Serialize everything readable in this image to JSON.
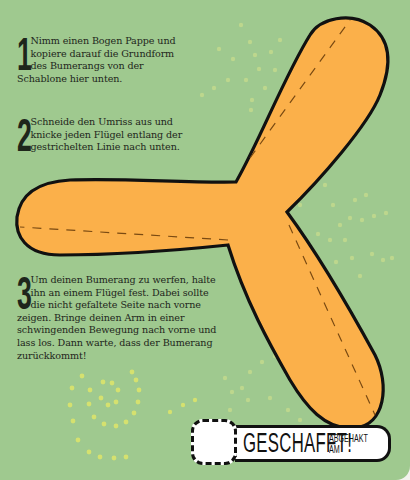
{
  "colors": {
    "background": "#9fc98f",
    "boomerang_fill": "#fbb04a",
    "outline": "#111111",
    "dots": "#d9e48a"
  },
  "steps": [
    {
      "number": "1",
      "text": "Nimm einen Bogen Pappe und kopiere darauf die Grundform des Bumerangs von der Schablone hier unten."
    },
    {
      "number": "2",
      "text": "Schneide den Umriss aus und knicke jeden Flügel entlang der gestrichelten Linie nach unten."
    },
    {
      "number": "3",
      "text": "Um deinen Bumerang zu werfen, halte ihn an einem Flügel fest. Dabei sollte die nicht gefaltete Seite nach vorne zeigen. Bringe deinen Arm in einer schwingenden Bewegung nach vorne und lass los. Dann warte, dass der Bumerang zurückkommt!"
    }
  ],
  "completion": {
    "title": "GESCHAFFT!",
    "subtitle_line1": "ABGEHAKT",
    "subtitle_line2": "AM"
  },
  "icons": {
    "template": "boomerang-template-icon",
    "checkbox": "dashed-checkbox-icon"
  }
}
